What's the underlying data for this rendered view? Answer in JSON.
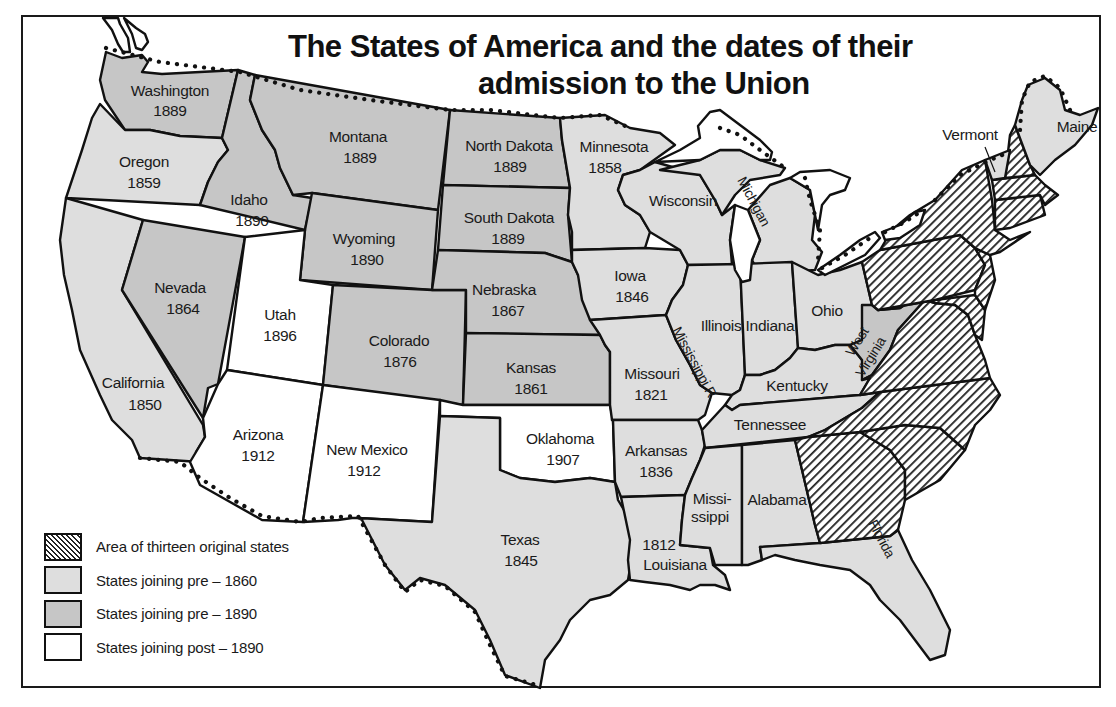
{
  "title": {
    "line1": "The States of America and the dates of their",
    "line2": "admission to the Union"
  },
  "legend": {
    "items": [
      {
        "key": "original",
        "label": "Area of thirteen original states",
        "pattern": "hatched"
      },
      {
        "key": "pre1860",
        "label": "States joining pre – 1860",
        "color": "#dedede"
      },
      {
        "key": "pre1890",
        "label": "States joining pre – 1890",
        "color": "#c6c6c6"
      },
      {
        "key": "post1890",
        "label": "States joining post – 1890",
        "color": "#ffffff"
      }
    ]
  },
  "colors": {
    "pre1860": "#dedede",
    "pre1890": "#c6c6c6",
    "post1890": "#ffffff",
    "outline": "#111111"
  },
  "states": {
    "washington": {
      "name": "Washington",
      "year": "1889",
      "category": "pre1890"
    },
    "oregon": {
      "name": "Oregon",
      "year": "1859",
      "category": "pre1860"
    },
    "california": {
      "name": "California",
      "year": "1850",
      "category": "pre1860"
    },
    "idaho": {
      "name": "Idaho",
      "year": "1890",
      "category": "pre1890"
    },
    "nevada": {
      "name": "Nevada",
      "year": "1864",
      "category": "pre1890"
    },
    "montana": {
      "name": "Montana",
      "year": "1889",
      "category": "pre1890"
    },
    "wyoming": {
      "name": "Wyoming",
      "year": "1890",
      "category": "pre1890"
    },
    "utah": {
      "name": "Utah",
      "year": "1896",
      "category": "post1890"
    },
    "arizona": {
      "name": "Arizona",
      "year": "1912",
      "category": "post1890"
    },
    "colorado": {
      "name": "Colorado",
      "year": "1876",
      "category": "pre1890"
    },
    "new_mexico": {
      "name": "New Mexico",
      "year": "1912",
      "category": "post1890"
    },
    "north_dakota": {
      "name": "North Dakota",
      "year": "1889",
      "category": "pre1890"
    },
    "south_dakota": {
      "name": "South Dakota",
      "year": "1889",
      "category": "pre1890"
    },
    "nebraska": {
      "name": "Nebraska",
      "year": "1867",
      "category": "pre1890"
    },
    "kansas": {
      "name": "Kansas",
      "year": "1861",
      "category": "pre1890"
    },
    "oklahoma": {
      "name": "Oklahoma",
      "year": "1907",
      "category": "post1890"
    },
    "texas": {
      "name": "Texas",
      "year": "1845",
      "category": "pre1860"
    },
    "minnesota": {
      "name": "Minnesota",
      "year": "1858",
      "category": "pre1860"
    },
    "iowa": {
      "name": "Iowa",
      "year": "1846",
      "category": "pre1860"
    },
    "missouri": {
      "name": "Missouri",
      "year": "1821",
      "category": "pre1860"
    },
    "arkansas": {
      "name": "Arkansas",
      "year": "1836",
      "category": "pre1860"
    },
    "louisiana": {
      "name": "Louisiana",
      "year": "1812",
      "category": "pre1860"
    },
    "wisconsin": {
      "name": "Wisconsin",
      "category": "pre1860"
    },
    "illinois": {
      "name": "Illinois",
      "category": "pre1860"
    },
    "michigan": {
      "name": "Michigan",
      "category": "pre1860"
    },
    "indiana": {
      "name": "Indiana",
      "category": "pre1860"
    },
    "ohio": {
      "name": "Ohio",
      "category": "pre1860"
    },
    "kentucky": {
      "name": "Kentucky",
      "category": "pre1860"
    },
    "tennessee": {
      "name": "Tennessee",
      "category": "pre1860"
    },
    "mississippi": {
      "name_line1": "Missi-",
      "name_line2": "ssippi",
      "category": "pre1860"
    },
    "alabama": {
      "name": "Alabama",
      "category": "pre1860"
    },
    "florida": {
      "name": "Florida",
      "category": "pre1860"
    },
    "west_virginia": {
      "name_line1": "West",
      "name_line2": "Virginia",
      "category": "pre1890"
    },
    "vermont": {
      "name": "Vermont",
      "category": "pre1860"
    },
    "maine": {
      "name": "Maine",
      "category": "pre1860"
    }
  },
  "annotations": {
    "river": "Mississippi R."
  }
}
